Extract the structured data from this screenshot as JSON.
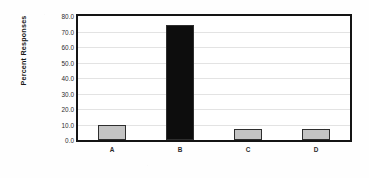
{
  "chart_data": {
    "type": "bar",
    "title": "",
    "xlabel": "",
    "ylabel": "Percent Responses",
    "categories": [
      "A",
      "B",
      "C",
      "D"
    ],
    "values": [
      9.8,
      74.0,
      7.0,
      7.0
    ],
    "ylim": [
      0.0,
      80.0
    ],
    "ytick_labels": [
      "0.0",
      "10.0",
      "20.0",
      "30.0",
      "40.0",
      "50.0",
      "60.0",
      "70.0",
      "80.0"
    ],
    "ytick_values": [
      0,
      10,
      20,
      30,
      40,
      50,
      60,
      70,
      80
    ],
    "grid": "horizontal",
    "legend": "none",
    "bar_colors": [
      "#c4c4c4",
      "#0d0d0d",
      "#c4c4c4",
      "#c4c4c4"
    ],
    "bar_edge_color": "#2e2e2e",
    "plot_border_color": "#141414",
    "gridline_color": "#e3e3e3",
    "background_color": "#ffffff"
  }
}
